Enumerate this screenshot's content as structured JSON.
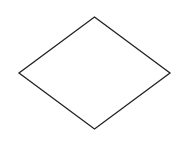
{
  "diagram": {
    "shape": "diamond",
    "stroke_color": "#222222",
    "fill_color": "#ffffff",
    "background": "#ffffff",
    "stroke_width": 1.3,
    "vertices": {
      "top": [
        94.5,
        17
      ],
      "right": [
        170,
        73
      ],
      "bottom": [
        94.5,
        129
      ],
      "left": [
        19,
        73
      ]
    },
    "label": ""
  }
}
